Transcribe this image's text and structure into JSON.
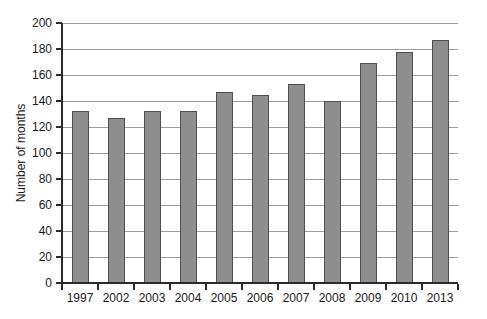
{
  "chart_data": {
    "type": "bar",
    "title": "",
    "xlabel": "",
    "ylabel": "Number of months",
    "categories": [
      "1997",
      "2002",
      "2003",
      "2004",
      "2005",
      "2006",
      "2007",
      "2008",
      "2009",
      "2010",
      "2013"
    ],
    "values": [
      132,
      127,
      132,
      132,
      147,
      145,
      153,
      140,
      169,
      178,
      187
    ],
    "ylim": [
      0,
      200
    ],
    "yticks": [
      0,
      20,
      40,
      60,
      80,
      100,
      120,
      140,
      160,
      180,
      200
    ],
    "grid": "horizontal",
    "legend_position": "none",
    "bar_color": "#8e8e8e",
    "bar_border_color": "#4f4f4f",
    "gridline_color": "#9b9b9b",
    "axis_color": "#2a2a2a",
    "text_color": "#1a1a1a",
    "background_color": "#ffffff"
  }
}
